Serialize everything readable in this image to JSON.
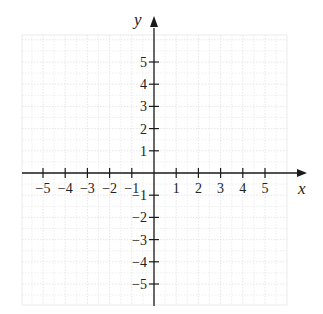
{
  "chart_data": {
    "type": "scatter",
    "title": "",
    "xlabel": "x",
    "ylabel": "y",
    "xlim": [
      -5.5,
      5.5
    ],
    "ylim": [
      -5.5,
      5.5
    ],
    "grid": true,
    "x_ticks": [
      -5,
      -4,
      -3,
      -2,
      -1,
      1,
      2,
      3,
      4,
      5
    ],
    "y_ticks": [
      -5,
      -4,
      -3,
      -2,
      -1,
      1,
      2,
      3,
      4,
      5
    ],
    "x_tick_labels": [
      "−5",
      "−4",
      "−3",
      "−2",
      "−1",
      "1",
      "2",
      "3",
      "4",
      "5"
    ],
    "y_tick_labels": [
      "−5",
      "−4",
      "−3",
      "−2",
      "−1",
      "1",
      "2",
      "3",
      "4",
      "5"
    ],
    "series": []
  },
  "axes": {
    "x_label": "x",
    "y_label": "y"
  },
  "colors": {
    "axis": "#1a1a1a",
    "grid": "#e3e3e3",
    "background": "#ffffff"
  }
}
